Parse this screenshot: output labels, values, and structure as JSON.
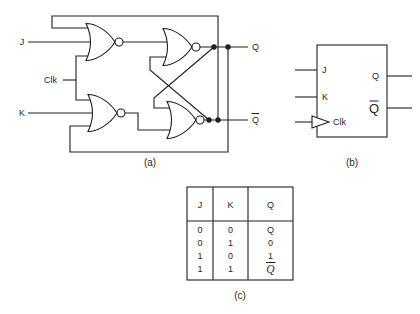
{
  "colors": {
    "ink": "#1f1f1f",
    "background": "#ffffff"
  },
  "panel_a": {
    "caption": "(a)",
    "labels": {
      "j": "J",
      "clk": "Clk",
      "k": "K",
      "q": "Q",
      "q_bar": {
        "t": "Q",
        "overline": true
      }
    }
  },
  "panel_b": {
    "caption": "(b)",
    "pins": {
      "j": "J",
      "k": "K",
      "clk": "Clk",
      "q": "Q",
      "q_bar": {
        "t": "Q",
        "overline": true
      }
    }
  },
  "panel_c": {
    "caption": "(c)",
    "headers": [
      {
        "t": "J"
      },
      {
        "t": "K"
      },
      {
        "t": "Q"
      }
    ],
    "rows": [
      [
        {
          "t": "0"
        },
        {
          "t": "0"
        },
        {
          "t": "Q"
        }
      ],
      [
        {
          "t": "0"
        },
        {
          "t": "1"
        },
        {
          "t": "0"
        }
      ],
      [
        {
          "t": "1"
        },
        {
          "t": "0"
        },
        {
          "t": "1"
        }
      ],
      [
        {
          "t": "1"
        },
        {
          "t": "1"
        },
        {
          "t": "Q",
          "overline": true,
          "italic": true
        }
      ]
    ]
  }
}
